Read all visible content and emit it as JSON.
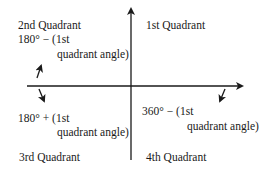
{
  "diagram": {
    "quadrants": [
      {
        "id": "q1",
        "name": "1st Quadrant",
        "formula_line1": "",
        "formula_line2": ""
      },
      {
        "id": "q2",
        "name": "2nd Quadrant",
        "formula_line1": "180° − (1st",
        "formula_line2": "quadrant angle)"
      },
      {
        "id": "q3",
        "name": "3rd Quadrant",
        "formula_line1": "180° + (1st",
        "formula_line2": "quadrant angle)"
      },
      {
        "id": "q4",
        "name": "4th Quadrant",
        "formula_line1": "360° − (1st",
        "formula_line2": "quadrant angle)"
      }
    ],
    "colors": {
      "line": "#1a1a1a",
      "background": "#ffffff"
    }
  }
}
